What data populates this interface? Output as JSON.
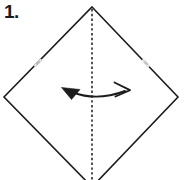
{
  "figure": {
    "step_label": "1.",
    "width": 185,
    "height": 180,
    "background_color": "#ffffff",
    "ink_color": "#1c1c1c",
    "crease_color": "#2a2a2a",
    "mark_color": "#d9d9d9"
  },
  "shape": {
    "name": "square-rotated-diamond",
    "vertices": [
      {
        "name": "top",
        "x": 92,
        "y": 7
      },
      {
        "name": "right",
        "x": 178,
        "y": 97
      },
      {
        "name": "bottom",
        "x": 92,
        "y": 187
      },
      {
        "name": "left",
        "x": 4,
        "y": 97
      }
    ],
    "edge_stroke_width": 1.6,
    "edge_style": "solid"
  },
  "crease_line": {
    "name": "vertical-valley-fold",
    "style": "dashed",
    "x": 92,
    "y_start": 9,
    "y_end": 180,
    "dash": "2.4 2.4",
    "stroke_width": 1.5
  },
  "reference_marks": [
    {
      "name": "left-edge-pinch-mark",
      "x": 38,
      "y": 63
    },
    {
      "name": "right-edge-pinch-mark",
      "x": 146,
      "y": 63
    }
  ],
  "fold_arrow": {
    "name": "fold-and-unfold-arrow",
    "label": "",
    "curve": "M 72 92 Q 96 102 126 91",
    "left_head": {
      "type": "solid-triangle",
      "points": "62,88 80,89 72,99"
    },
    "right_head": {
      "type": "open-barb",
      "path": "M 115 83 L 130 90.5 L 116 96"
    },
    "stroke_width": 1.8
  }
}
